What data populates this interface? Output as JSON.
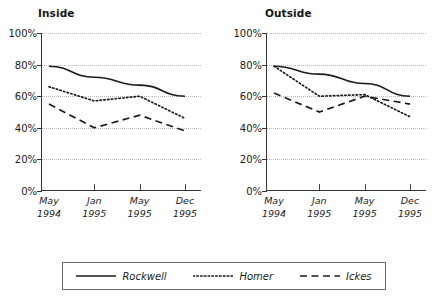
{
  "chart_data": [
    {
      "type": "line",
      "title": "Inside",
      "xlabel": "",
      "ylabel": "",
      "x": [
        "May 1994",
        "Jan 1995",
        "May 1995",
        "Dec 1995"
      ],
      "categories": [
        "May\n1994",
        "Jan\n1995",
        "May\n1995",
        "Dec\n1995"
      ],
      "ylim": [
        0,
        100
      ],
      "yticks": [
        0,
        20,
        40,
        60,
        80,
        100
      ],
      "ytick_labels": [
        "0%",
        "20%",
        "40%",
        "60%",
        "80%",
        "100%"
      ],
      "grid": true,
      "legend": "bottom",
      "series": [
        {
          "name": "Rockwell",
          "style": "solid",
          "values": [
            79,
            72,
            67,
            60
          ]
        },
        {
          "name": "Homer",
          "style": "dotted",
          "values": [
            66,
            57,
            60,
            46
          ]
        },
        {
          "name": "Ickes",
          "style": "dashed",
          "values": [
            55,
            40,
            48,
            38
          ]
        }
      ]
    },
    {
      "type": "line",
      "title": "Outside",
      "xlabel": "",
      "ylabel": "",
      "x": [
        "May 1994",
        "Jan 1995",
        "May 1995",
        "Dec 1995"
      ],
      "categories": [
        "May\n1994",
        "Jan\n1995",
        "May\n1995",
        "Dec\n1995"
      ],
      "ylim": [
        0,
        100
      ],
      "yticks": [
        0,
        20,
        40,
        60,
        80,
        100
      ],
      "ytick_labels": [
        "0%",
        "20%",
        "40%",
        "60%",
        "80%",
        "100%"
      ],
      "grid": true,
      "legend": "bottom",
      "series": [
        {
          "name": "Rockwell",
          "style": "solid",
          "values": [
            79,
            74,
            68,
            60
          ]
        },
        {
          "name": "Homer",
          "style": "dotted",
          "values": [
            79,
            60,
            61,
            47
          ]
        },
        {
          "name": "Ickes",
          "style": "dashed",
          "values": [
            62,
            50,
            60,
            55
          ]
        }
      ]
    }
  ],
  "panels": [
    {
      "title": "Inside",
      "ytick_labels": [
        "100%",
        "80%",
        "60%",
        "40%",
        "20%",
        "0%"
      ],
      "xtick_labels": [
        {
          "line1": "May",
          "line2": "1994"
        },
        {
          "line1": "Jan",
          "line2": "1995"
        },
        {
          "line1": "May",
          "line2": "1995"
        },
        {
          "line1": "Dec",
          "line2": "1995"
        }
      ]
    },
    {
      "title": "Outside",
      "ytick_labels": [
        "100%",
        "80%",
        "60%",
        "40%",
        "20%",
        "0%"
      ],
      "xtick_labels": [
        {
          "line1": "May",
          "line2": "1994"
        },
        {
          "line1": "Jan",
          "line2": "1995"
        },
        {
          "line1": "May",
          "line2": "1995"
        },
        {
          "line1": "Dec",
          "line2": "1995"
        }
      ]
    }
  ],
  "legend": {
    "items": [
      {
        "label": "Rockwell",
        "style": "solid"
      },
      {
        "label": "Homer",
        "style": "dotted"
      },
      {
        "label": "Ickes",
        "style": "dashed"
      }
    ]
  },
  "colors": {
    "line": "#1b1b1b",
    "axis": "#333333",
    "grid": "#b9b9b9",
    "legend_border": "#6d6d6d",
    "background": "#ffffff",
    "text": "#1a1a1a"
  }
}
